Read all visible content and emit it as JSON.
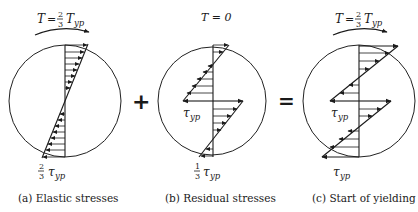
{
  "figure": {
    "panels": [
      {
        "id": "a",
        "torque_label": {
          "lhs": "T",
          "eq": "=",
          "num": "2",
          "den": "3",
          "rhs": "T",
          "sub": "yp"
        },
        "stress_label": {
          "num": "2",
          "den": "3",
          "sym": "τ",
          "sub": "yp"
        },
        "caption": "(a)  Elastic stresses"
      },
      {
        "id": "b",
        "torque_label": {
          "text": "T = 0"
        },
        "inner_label": {
          "sym": "τ",
          "sub": "yp"
        },
        "stress_label": {
          "num": "1",
          "den": "3",
          "sym": "τ",
          "sub": "yp"
        },
        "caption": "(b)  Residual stresses"
      },
      {
        "id": "c",
        "torque_label": {
          "lhs": "T",
          "eq": "=",
          "num": "2",
          "den": "3",
          "rhs": "T",
          "sub": "yp"
        },
        "inner_label": {
          "sym": "τ",
          "sub": "yp"
        },
        "stress_label": {
          "sym": "τ",
          "sub": "yp"
        },
        "caption": "(c)  Start of yielding"
      }
    ],
    "operators": {
      "plus": "+",
      "equals": "="
    }
  }
}
